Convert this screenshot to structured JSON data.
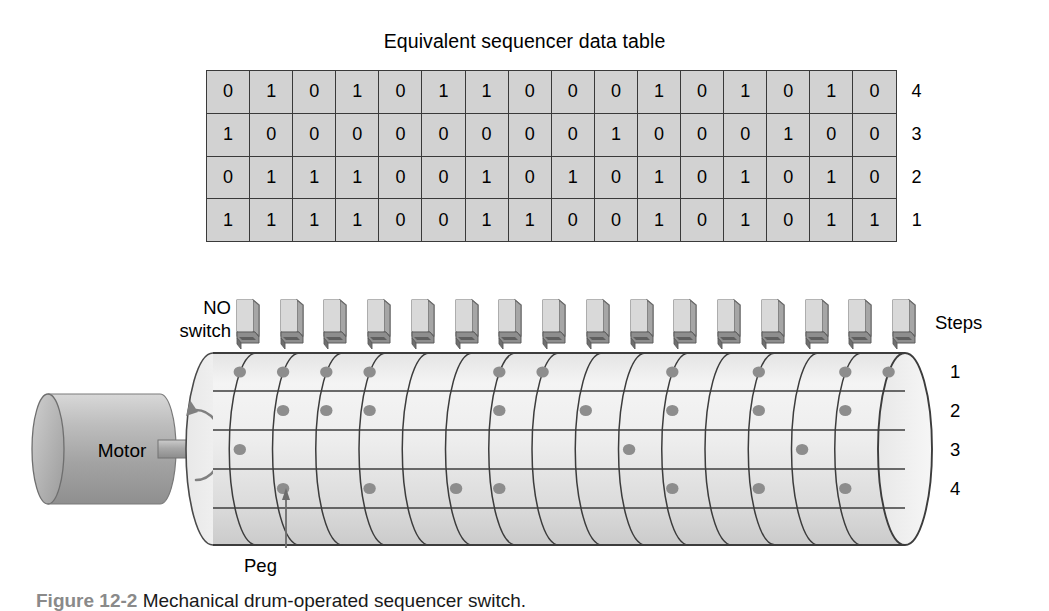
{
  "table": {
    "title": "Equivalent sequencer data table",
    "columns": 16,
    "rows": [
      {
        "label": "4",
        "values": [
          0,
          1,
          0,
          1,
          0,
          1,
          1,
          0,
          0,
          0,
          1,
          0,
          1,
          0,
          1,
          0
        ]
      },
      {
        "label": "3",
        "values": [
          1,
          0,
          0,
          0,
          0,
          0,
          0,
          0,
          0,
          1,
          0,
          0,
          0,
          1,
          0,
          0
        ]
      },
      {
        "label": "2",
        "values": [
          0,
          1,
          1,
          1,
          0,
          0,
          1,
          0,
          1,
          0,
          1,
          0,
          1,
          0,
          1,
          0
        ]
      },
      {
        "label": "1",
        "values": [
          1,
          1,
          1,
          1,
          0,
          0,
          1,
          1,
          0,
          0,
          1,
          0,
          1,
          0,
          1,
          1
        ]
      }
    ]
  },
  "labels": {
    "no_switch": "NO\nswitch",
    "no_switch_line1": "NO",
    "no_switch_line2": "switch",
    "steps": "Steps",
    "motor": "Motor",
    "peg": "Peg"
  },
  "drum": {
    "step_labels": [
      "1",
      "2",
      "3",
      "4"
    ],
    "steps": 16,
    "tracks": 4,
    "peg_grid": [
      [
        1,
        1,
        1,
        1,
        0,
        0,
        1,
        1,
        0,
        0,
        1,
        0,
        1,
        0,
        1,
        1
      ],
      [
        0,
        1,
        1,
        1,
        0,
        0,
        1,
        0,
        1,
        0,
        1,
        0,
        1,
        0,
        1,
        0
      ],
      [
        1,
        0,
        0,
        0,
        0,
        0,
        0,
        0,
        0,
        1,
        0,
        0,
        0,
        1,
        0,
        0
      ],
      [
        0,
        1,
        0,
        1,
        0,
        1,
        1,
        0,
        0,
        0,
        1,
        0,
        1,
        0,
        1,
        0
      ]
    ],
    "peg_callout_step": 2,
    "peg_callout_track": 4
  },
  "switches": {
    "count": 16,
    "type": "NO",
    "icon": "limit-switch-icon"
  },
  "caption": {
    "figure_number": "Figure 12-2",
    "text": "Mechanical drum-operated sequencer switch."
  },
  "colors": {
    "cell_fill": "#d2d2d2",
    "cell_border": "#3a3a3a",
    "drum_body_light": "#f2f2f2",
    "drum_body_mid": "#dcdcdc",
    "motor_body": "#b4b4b4",
    "peg": "#8d8d8d",
    "switch_face": "#cfcfcf",
    "switch_side": "#9a9a9a",
    "lever": "#6e6e6e",
    "text": "#000000"
  }
}
